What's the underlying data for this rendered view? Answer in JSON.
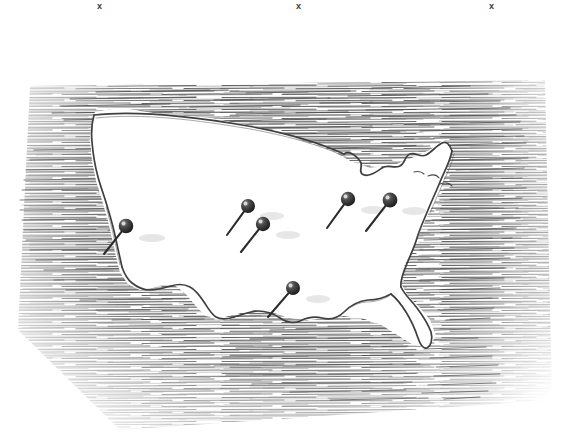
{
  "illustration": {
    "title": "Pen-and-ink map of the contiguous United States with push pins",
    "medium": "pen-and-ink line drawing",
    "background_color": "#ffffff",
    "ink_color": "#4a4a4a",
    "pin_color": "#2b2b2b",
    "shadow_color": "#cfcfcf",
    "canvas": {
      "width": 572,
      "height": 446
    }
  },
  "crop_marks": [
    {
      "label": "x",
      "x": 97,
      "y": 2
    },
    {
      "label": "x",
      "x": 296,
      "y": 2
    },
    {
      "label": "x",
      "x": 489,
      "y": 2
    }
  ],
  "map": {
    "region_name": "contiguous united states",
    "outline_note": "hand-drawn wobbly coastline, interior left blank white",
    "hatching_note": "dense horizontal pen hatching fills surrounding ocean and land beyond the borders, fading at the outer edges"
  },
  "pins": [
    {
      "id": "pin-west",
      "head_x": 126,
      "head_y": 226,
      "tip_x": 104,
      "tip_y": 254,
      "shadow_x": 152,
      "shadow_y": 238
    },
    {
      "id": "pin-midwest-upper",
      "head_x": 248,
      "head_y": 206,
      "tip_x": 227,
      "tip_y": 235,
      "shadow_x": 272,
      "shadow_y": 216
    },
    {
      "id": "pin-midwest-lower",
      "head_x": 263,
      "head_y": 224,
      "tip_x": 241,
      "tip_y": 252,
      "shadow_x": 288,
      "shadow_y": 235
    },
    {
      "id": "pin-south",
      "head_x": 293,
      "head_y": 288,
      "tip_x": 268,
      "tip_y": 317,
      "shadow_x": 318,
      "shadow_y": 299
    },
    {
      "id": "pin-great-lakes-west",
      "head_x": 348,
      "head_y": 199,
      "tip_x": 327,
      "tip_y": 228,
      "shadow_x": 373,
      "shadow_y": 210
    },
    {
      "id": "pin-northeast",
      "head_x": 390,
      "head_y": 200,
      "tip_x": 366,
      "tip_y": 231,
      "shadow_x": 414,
      "shadow_y": 211
    }
  ]
}
